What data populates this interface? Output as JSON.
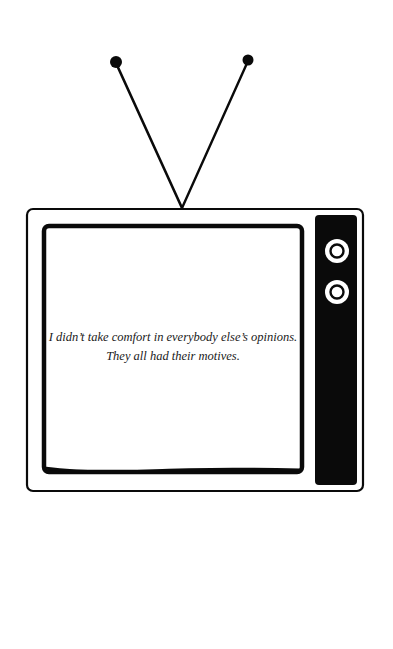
{
  "illustration": {
    "subject": "retro-television",
    "colors": {
      "ink": "#0a0a0a",
      "paper": "#ffffff",
      "knob": "#ffffff"
    }
  },
  "screen": {
    "quote_lines": [
      "I didn’t take comfort in everybody else’s opinions.",
      "They all had their motives."
    ]
  },
  "controls": {
    "knobs": [
      {
        "name": "knob-top"
      },
      {
        "name": "knob-bottom"
      }
    ]
  }
}
